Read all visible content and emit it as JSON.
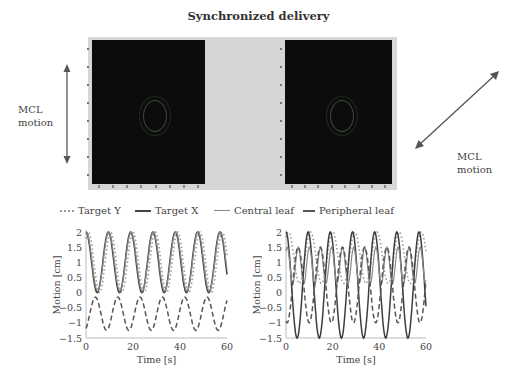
{
  "figure": {
    "title": "Synchronized delivery",
    "left_annotation": {
      "line1": "MCL",
      "line2": "motion",
      "arrow": "vertical-double-arrow"
    },
    "right_annotation": {
      "line1": "MCL",
      "line2": "motion",
      "arrow": "diagonal-double-arrow"
    },
    "legend": [
      {
        "label": "Target Y",
        "style": "dotted",
        "color": "#999999"
      },
      {
        "label": "Target X",
        "style": "solid-thick",
        "color": "#444444"
      },
      {
        "label": "Central leaf",
        "style": "solid-thin",
        "color": "#888888"
      },
      {
        "label": "Peripheral leaf",
        "style": "dashed",
        "color": "#555555"
      }
    ],
    "colors": {
      "scan_bg": "#0c0c0c",
      "panel_bg": "#d6d6d6",
      "text": "#333333"
    }
  },
  "chart_data": [
    {
      "type": "line",
      "title": "",
      "xlabel": "Time [s]",
      "ylabel": "Motion [cm]",
      "xlim": [
        0,
        60
      ],
      "ylim": [
        -1.5,
        2
      ],
      "xticks": [
        "0",
        "20",
        "40",
        "60"
      ],
      "yticks": [
        "2",
        "1.5",
        "1",
        "0.5",
        "0",
        "−0.5",
        "−1",
        "−1.5"
      ],
      "grid": false,
      "series": [
        {
          "name": "Target Y",
          "period": 9.5,
          "min": 0.0,
          "max": 2.0,
          "phase": 1.0
        },
        {
          "name": "Target X",
          "period": 9.5,
          "min": 0.0,
          "max": 2.0,
          "phase": 0.0
        },
        {
          "name": "Central leaf",
          "period": 9.5,
          "min": 0.05,
          "max": 2.0,
          "phase": 0.2
        },
        {
          "name": "Peripheral leaf",
          "period": 9.5,
          "min": -1.25,
          "max": -0.15,
          "phase": 4.0
        }
      ]
    },
    {
      "type": "line",
      "title": "",
      "xlabel": "Time [s]",
      "ylabel": "Motion [cm]",
      "xlim": [
        0,
        60
      ],
      "ylim": [
        -1.5,
        2
      ],
      "xticks": [
        "0",
        "20",
        "40",
        "60"
      ],
      "yticks": [
        "2",
        "1.5",
        "1",
        "0.5",
        "0",
        "−0.5",
        "−1",
        "−1.5"
      ],
      "grid": false,
      "series": [
        {
          "name": "Target Y",
          "period": 9.5,
          "min": 0.3,
          "max": 2.0,
          "phase": 1.0
        },
        {
          "name": "Target X",
          "period": 9.5,
          "min": -1.5,
          "max": 2.0,
          "phase": 0.0
        },
        {
          "name": "Central leaf",
          "period": 4.75,
          "min": 0.3,
          "max": 1.5,
          "phase": 0.5
        },
        {
          "name": "Peripheral leaf",
          "period": 9.5,
          "min": -1.0,
          "max": 1.5,
          "phase": 5.2
        }
      ]
    }
  ]
}
